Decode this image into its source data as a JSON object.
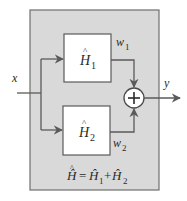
{
  "diagram": {
    "type": "block-diagram",
    "colors": {
      "outer_fill": "#d9d9d9",
      "outer_stroke": "#6e6e6e",
      "block_fill": "#ffffff",
      "line": "#5a5a5a",
      "text": "#2a2a2a",
      "background": "#ffffff"
    },
    "input": {
      "label": "x"
    },
    "output": {
      "label": "y"
    },
    "blocks": [
      {
        "id": "H1",
        "symbol": "H",
        "hat": "^",
        "subscript": "1"
      },
      {
        "id": "H2",
        "symbol": "H",
        "hat": "^",
        "subscript": "2"
      }
    ],
    "signals": [
      {
        "name": "w",
        "subscript": "1",
        "from": "H1",
        "to": "sum"
      },
      {
        "name": "w",
        "subscript": "2",
        "from": "H2",
        "to": "sum"
      }
    ],
    "summing_junction": {
      "symbol": "+"
    },
    "equation": {
      "lhs": "Ĥ",
      "equals": "=",
      "term1": "Ĥ",
      "term1_sub": "1",
      "plus": "+",
      "term2": "Ĥ",
      "term2_sub": "2"
    }
  }
}
